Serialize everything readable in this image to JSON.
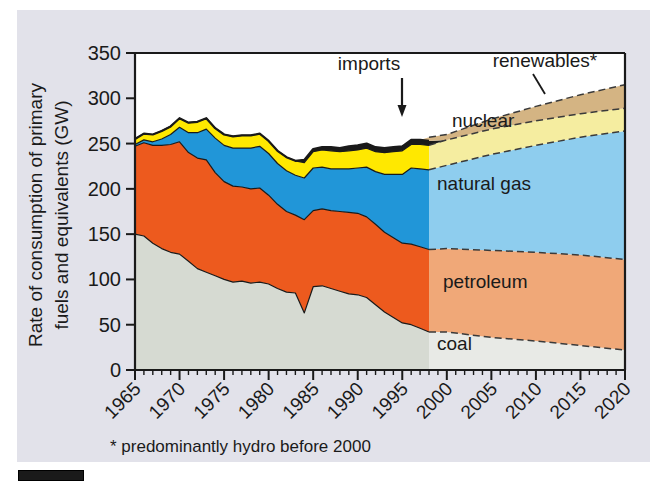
{
  "figure": {
    "y_axis_title_line1": "Rate of consumption of primary",
    "y_axis_title_line2": "fuels and equivalents (GW)",
    "footnote": "* predominantly hydro before 2000",
    "callout_imports": "imports",
    "callout_renewables": "renewables*"
  },
  "labels": {
    "nuclear": "nuclear",
    "natural_gas": "natural gas",
    "petroleum": "petroleum",
    "coal": "coal"
  },
  "colors": {
    "coal_hist": "#d6dad2",
    "coal_proj": "#e8eae6",
    "petroleum_hist": "#ed5a1e",
    "petroleum_proj": "#f0a878",
    "gas_hist": "#2196d8",
    "gas_proj": "#8ecdee",
    "nuclear_hist": "#ffe800",
    "nuclear_proj": "#f5eda0",
    "imports_hist": "#1a1a1a",
    "renewables_proj": "#d4b483",
    "panel_bg": "#e2e2ea",
    "plot_bg": "#ffffff",
    "axis": "#1a1a1a"
  },
  "chart_data": {
    "type": "area",
    "title": "",
    "xlabel": "",
    "ylabel": "Rate of consumption of primary fuels and equivalents (GW)",
    "xlim": [
      1965,
      2020
    ],
    "ylim": [
      0,
      350
    ],
    "yticks": [
      0,
      50,
      100,
      150,
      200,
      250,
      300,
      350
    ],
    "xticks": [
      1965,
      1970,
      1975,
      1980,
      1985,
      1990,
      1995,
      2000,
      2005,
      2010,
      2015,
      2020
    ],
    "minor_xtick_step": 1,
    "grid": false,
    "legend": "inline-labels",
    "stack_order": [
      "coal",
      "petroleum",
      "natural gas",
      "nuclear",
      "imports",
      "renewables"
    ],
    "projection_start_year": 1998,
    "annotations": [
      {
        "text": "imports",
        "year": 1995,
        "value": 300,
        "kind": "arrow-callout"
      },
      {
        "text": "renewables*",
        "year": 2012,
        "value": 330,
        "kind": "leader-callout"
      }
    ],
    "x": [
      1965,
      1966,
      1967,
      1968,
      1969,
      1970,
      1971,
      1972,
      1973,
      1974,
      1975,
      1976,
      1977,
      1978,
      1979,
      1980,
      1981,
      1982,
      1983,
      1984,
      1985,
      1986,
      1987,
      1988,
      1989,
      1990,
      1991,
      1992,
      1993,
      1994,
      1995,
      1996,
      1997,
      1998,
      2000,
      2005,
      2010,
      2015,
      2020
    ],
    "series": [
      {
        "name": "coal",
        "values": [
          150,
          148,
          140,
          134,
          130,
          128,
          120,
          112,
          108,
          104,
          100,
          97,
          98,
          96,
          97,
          95,
          90,
          86,
          85,
          63,
          92,
          93,
          90,
          87,
          84,
          83,
          80,
          72,
          64,
          58,
          52,
          50,
          46,
          42,
          42,
          36,
          32,
          27,
          22
        ]
      },
      {
        "name": "petroleum",
        "values": [
          97,
          103,
          108,
          114,
          119,
          124,
          120,
          122,
          124,
          114,
          108,
          106,
          104,
          104,
          104,
          98,
          93,
          89,
          86,
          103,
          84,
          85,
          86,
          88,
          90,
          90,
          89,
          89,
          88,
          88,
          88,
          89,
          90,
          91,
          92,
          96,
          98,
          100,
          100
        ]
      },
      {
        "name": "natural gas",
        "values": [
          2,
          3,
          4,
          7,
          11,
          16,
          22,
          28,
          34,
          38,
          40,
          42,
          43,
          45,
          46,
          46,
          45,
          45,
          44,
          46,
          47,
          46,
          46,
          47,
          48,
          50,
          55,
          58,
          64,
          70,
          76,
          84,
          86,
          88,
          92,
          106,
          118,
          130,
          142
        ]
      },
      {
        "name": "nuclear",
        "values": [
          6,
          7,
          8,
          9,
          9,
          10,
          11,
          12,
          12,
          11,
          12,
          13,
          14,
          14,
          14,
          14,
          14,
          15,
          16,
          17,
          18,
          19,
          20,
          19,
          20,
          20,
          21,
          22,
          24,
          25,
          26,
          26,
          27,
          27,
          28,
          28,
          27,
          26,
          25
        ]
      },
      {
        "name": "imports",
        "values": [
          0,
          0,
          0,
          0,
          0,
          0,
          0,
          0,
          0,
          0,
          0,
          0,
          0,
          0,
          0,
          0,
          0,
          0,
          0,
          3,
          3,
          3,
          4,
          4,
          5,
          5,
          5,
          5,
          5,
          5,
          5,
          5,
          5,
          5,
          0,
          0,
          0,
          0,
          0
        ]
      },
      {
        "name": "renewables",
        "values": [
          0,
          0,
          0,
          0,
          0,
          0,
          0,
          0,
          0,
          0,
          0,
          0,
          0,
          0,
          0,
          0,
          0,
          0,
          0,
          0,
          0,
          0,
          0,
          0,
          0,
          0,
          0,
          0,
          0,
          0,
          0,
          0,
          0,
          4,
          6,
          11,
          16,
          21,
          26
        ]
      }
    ]
  }
}
